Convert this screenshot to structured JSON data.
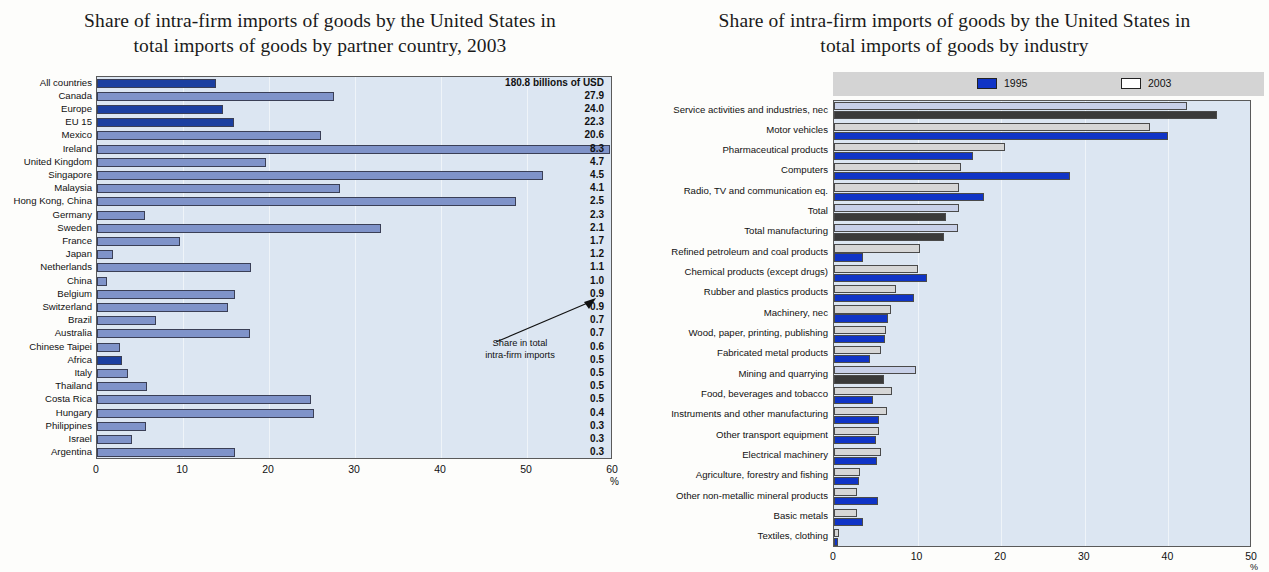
{
  "left": {
    "title_line1": "Share of intra-firm imports of goods by the United States in",
    "title_line2": "total imports of goods by partner country, 2003",
    "annotation_line1": "Share in total",
    "annotation_line2": "intra-firm imports",
    "axis_unit": "%",
    "first_value_label": "180.8 billions of USD",
    "colors": {
      "bar_light": "#7f93c9",
      "bar_dark": "#1b3fa0",
      "plot_bg": "#dce6f2"
    }
  },
  "right": {
    "title_line1": "Share of intra-firm imports of goods by the United States in",
    "title_line2": "total imports of goods by industry",
    "legend": [
      {
        "label": "1995",
        "color": "#1034c6"
      },
      {
        "label": "2003",
        "color": "#ffffff"
      }
    ],
    "axis_unit": "%",
    "colors": {
      "bar_1995": "#1034c6",
      "bar_2003": "#d6d6d6",
      "plot_bg": "#dce6f2"
    }
  },
  "chart_data": [
    {
      "type": "bar",
      "orientation": "horizontal",
      "title": "Share of intra-firm imports of goods by the United States in total imports of goods by partner country, 2003",
      "xlabel": "%",
      "ylabel": "",
      "xlim": [
        0,
        60
      ],
      "xticks": [
        0,
        10,
        20,
        30,
        40,
        50,
        60
      ],
      "grid": true,
      "legend": "none",
      "annotation": "Share in total intra-firm imports",
      "categories": [
        "All countries",
        "Canada",
        "Europe",
        "EU 15",
        "Mexico",
        "Ireland",
        "United Kingdom",
        "Singapore",
        "Malaysia",
        "Hong Kong, China",
        "Germany",
        "Sweden",
        "France",
        "Japan",
        "Netherlands",
        "China",
        "Belgium",
        "Switzerland",
        "Brazil",
        "Australia",
        "Chinese Taipei",
        "Africa",
        "Italy",
        "Thailand",
        "Costa Rica",
        "Hungary",
        "Philippines",
        "Israel",
        "Argentina"
      ],
      "values": [
        13.8,
        27.5,
        14.7,
        15.9,
        26.0,
        59.6,
        19.6,
        51.9,
        28.2,
        48.7,
        5.6,
        33.0,
        9.7,
        1.9,
        17.9,
        1.2,
        16.1,
        15.2,
        6.9,
        17.8,
        2.7,
        2.9,
        3.6,
        5.8,
        24.9,
        25.2,
        5.7,
        4.1,
        16.1
      ],
      "value_labels": [
        "180.8 billions of USD",
        "27.9",
        "24.0",
        "22.3",
        "20.6",
        "8.3",
        "4.7",
        "4.5",
        "4.1",
        "2.5",
        "2.3",
        "2.1",
        "1.7",
        "1.2",
        "1.1",
        "1.0",
        "0.9",
        "0.9",
        "0.7",
        "0.7",
        "0.6",
        "0.5",
        "0.5",
        "0.5",
        "0.5",
        "0.4",
        "0.3",
        "0.3",
        "0.3"
      ],
      "highlighted": [
        0,
        2,
        3,
        21
      ],
      "note": "Bar length = share of intra-firm imports in total imports from that partner (%); right-hand column = share in total intra-firm imports (%), first row shows total value in billions of USD."
    },
    {
      "type": "bar",
      "orientation": "horizontal",
      "title": "Share of intra-firm imports of goods by the United States in total imports of goods by industry",
      "xlabel": "%",
      "ylabel": "",
      "xlim": [
        0,
        50
      ],
      "xticks": [
        0,
        10,
        20,
        30,
        40,
        50
      ],
      "grid": true,
      "legend_position": "top",
      "categories": [
        "Service activities and industries, nec",
        "Motor vehicles",
        "Pharmaceutical products",
        "Computers",
        "Radio, TV and communication eq.",
        "Total",
        "Total manufacturing",
        "Refined petroleum and coal products",
        "Chemical products (except drugs)",
        "Rubber and plastics products",
        "Machinery, nec",
        "Wood, paper, printing, publishing",
        "Fabricated metal products",
        "Mining and quarrying",
        "Food, beverages and tobacco",
        "Instruments and other manufacturing",
        "Other transport equipment",
        "Electrical machinery",
        "Agriculture, forestry and fishing",
        "Other non-metallic mineral products",
        "Basic metals",
        "Textiles, clothing"
      ],
      "series": [
        {
          "name": "2003",
          "values": [
            42.2,
            37.8,
            20.5,
            15.2,
            14.9,
            15.0,
            14.8,
            10.3,
            10.0,
            7.4,
            6.8,
            6.2,
            5.6,
            9.8,
            6.9,
            6.3,
            5.4,
            5.6,
            3.1,
            2.7,
            2.8,
            0.6
          ]
        },
        {
          "name": "1995",
          "values": [
            45.8,
            40.0,
            16.6,
            28.2,
            18.0,
            13.4,
            13.2,
            3.5,
            11.1,
            9.6,
            6.4,
            6.1,
            4.3,
            6.0,
            4.7,
            5.4,
            5.0,
            5.2,
            3.0,
            5.3,
            3.5,
            0.5
          ]
        }
      ],
      "dark_rows": [
        0,
        5,
        6,
        13
      ]
    }
  ]
}
